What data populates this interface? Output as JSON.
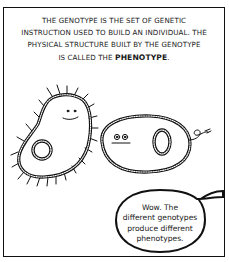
{
  "comic": {
    "caption": {
      "line1": "THE GENOTYPE IS THE SET OF GENETIC",
      "line2": "INSTRUCTION USED TO BUILD AN INDIVIDUAL. THE",
      "line3": "PHYSICAL STRUCTURE BUILT BY THE GENOTYPE",
      "line4_prefix": "IS CALLED THE ",
      "line4_bold": "PHENOTYPE",
      "line4_suffix": "."
    },
    "characters": [
      {
        "name": "hairy-bacterium",
        "expression": "smiling",
        "feature": "cilia"
      },
      {
        "name": "flagellated-cell",
        "expression": "neutral",
        "feature": "flagellum"
      }
    ],
    "speech_bubble": {
      "line1": "Wow. The",
      "line2": "different genotypes",
      "line3": "produce different",
      "line4": "phenotypes."
    }
  }
}
